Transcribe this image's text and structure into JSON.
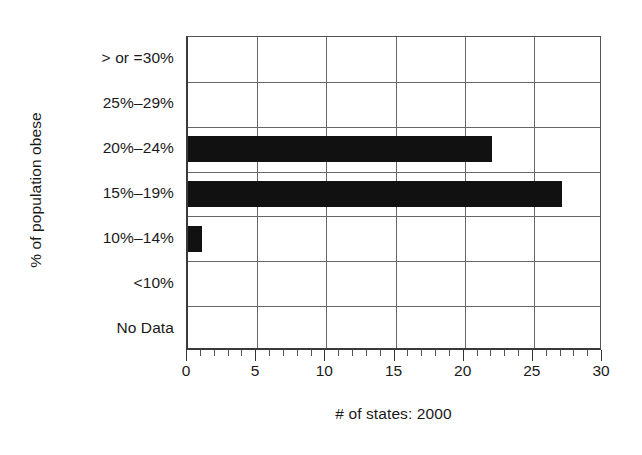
{
  "chart_data": {
    "type": "bar",
    "orientation": "horizontal",
    "title": "",
    "subtitle": "",
    "xlabel": "# of states: 2000",
    "ylabel": "% of population obese",
    "categories": [
      "No Data",
      "<10%",
      "10%–14%",
      "15%–19%",
      "20%–24%",
      "25%–29%",
      "> or =30%"
    ],
    "values": [
      0,
      0,
      1,
      27,
      22,
      0,
      0
    ],
    "xlim": [
      0,
      30
    ],
    "xticks": [
      0,
      5,
      10,
      15,
      20,
      25,
      30
    ],
    "xtick_labels": [
      "0",
      "5",
      "10",
      "15",
      "20",
      "25",
      "30"
    ],
    "minor_tick_step": 1,
    "grid": "both",
    "legend": "none",
    "series": [
      {
        "name": "# of states: 2000",
        "color": "#111111",
        "values": [
          0,
          0,
          1,
          27,
          22,
          0,
          0
        ]
      }
    ],
    "annotations": []
  },
  "figure": {
    "background_color": "#ffffff",
    "axis_color": "#333333",
    "grid_color": "#666666",
    "bar_color": "#111111",
    "text_color": "#1a1a1a"
  }
}
